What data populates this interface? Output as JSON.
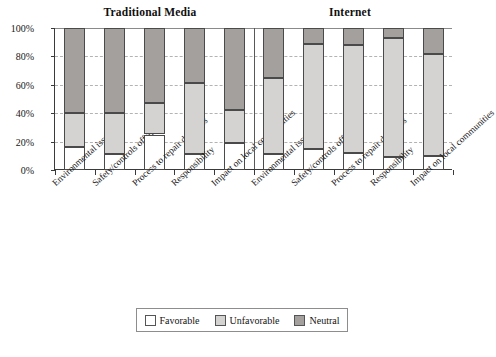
{
  "chart_data": {
    "type": "bar",
    "subtype": "stacked-100-percent",
    "title": "",
    "panels": [
      {
        "name": "Traditional Media",
        "title": "Traditional Media"
      },
      {
        "name": "Internet",
        "title": "Internet"
      }
    ],
    "categories": [
      "Environmental issues",
      "Safety/controls offshore",
      "Process to repair damages",
      "Responsibility",
      "Impact on local communities"
    ],
    "series": [
      {
        "name": "Favorable",
        "color": "#ffffff",
        "values_traditional": [
          16,
          11,
          25,
          11,
          19
        ],
        "values_internet": [
          11,
          15,
          12,
          9,
          10
        ]
      },
      {
        "name": "Unfavorable",
        "color": "#d5d3d1",
        "values_traditional": [
          24,
          29,
          22,
          50,
          23
        ],
        "values_internet": [
          54,
          74,
          76,
          84,
          72
        ]
      },
      {
        "name": "Neutral",
        "color": "#a3a09e",
        "values_traditional": [
          60,
          60,
          53,
          39,
          58
        ],
        "values_internet": [
          35,
          11,
          12,
          7,
          18
        ]
      }
    ],
    "cumulative_boundaries": {
      "traditional": [
        {
          "category": "Environmental issues",
          "favorable_top": 16,
          "unfavorable_top": 40
        },
        {
          "category": "Safety/controls offshore",
          "favorable_top": 11,
          "unfavorable_top": 40
        },
        {
          "category": "Process to repair damages",
          "favorable_top": 25,
          "unfavorable_top": 47
        },
        {
          "category": "Responsibility",
          "favorable_top": 11,
          "unfavorable_top": 61
        },
        {
          "category": "Impact on local communities",
          "favorable_top": 19,
          "unfavorable_top": 42
        }
      ],
      "internet": [
        {
          "category": "Environmental issues",
          "favorable_top": 11,
          "unfavorable_top": 65
        },
        {
          "category": "Safety/controls offshore",
          "favorable_top": 15,
          "unfavorable_top": 89
        },
        {
          "category": "Process to repair damages",
          "favorable_top": 12,
          "unfavorable_top": 88
        },
        {
          "category": "Responsibility",
          "favorable_top": 9,
          "unfavorable_top": 93
        },
        {
          "category": "Impact on local communities",
          "favorable_top": 10,
          "unfavorable_top": 82
        }
      ]
    },
    "xlabel": "",
    "ylabel": "",
    "ylim": [
      0,
      100
    ],
    "yticks": [
      0,
      20,
      40,
      60,
      80,
      100
    ],
    "ytick_labels": [
      "0%",
      "20%",
      "40%",
      "60%",
      "80%",
      "100%"
    ],
    "grid": true,
    "grid_axis": "y",
    "legend": {
      "position": "bottom",
      "entries": [
        {
          "label": "Favorable",
          "color": "#ffffff"
        },
        {
          "label": "Unfavorable",
          "color": "#d5d3d1"
        },
        {
          "label": "Neutral",
          "color": "#a3a09e"
        }
      ]
    }
  }
}
